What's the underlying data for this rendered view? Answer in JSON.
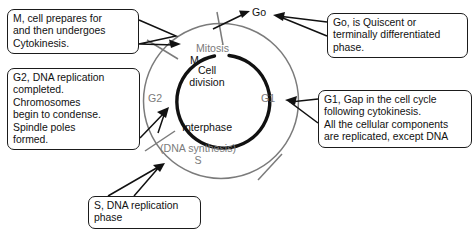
{
  "diagram": {
    "colors": {
      "outer_ring": "#7b7b7b",
      "inner_arc": "#111111",
      "text_black": "#111111",
      "text_gray": "#7b7b7b",
      "callout_border": "#1b1b1b",
      "background": "#ffffff"
    },
    "ring_labels": {
      "mitosis": "Mitosis",
      "m": "M",
      "g2": "G2",
      "g1": "G1",
      "dna_synthesis": "(DNA synthesis)",
      "s": "S"
    },
    "inner_labels": {
      "cell_division_line1": "Cell",
      "cell_division_line2": "division",
      "interphase": "Interphase"
    },
    "exit_label": "Go"
  },
  "callouts": {
    "m_phase": {
      "text": "M, cell prepares for\nand then undergoes\nCytokinesis."
    },
    "g2_phase": {
      "text": "G2, DNA replication\ncompleted.\nChromosomes\nbegin to condense.\nSpindle poles\nformed."
    },
    "g0_phase": {
      "text": "Go, is Quiscent or\nterminally differentiated\nphase."
    },
    "g1_phase": {
      "text": "G1, Gap in the cell cycle\nfollowing cytokinesis.\nAll the cellular components\nare replicated, except DNA"
    },
    "s_phase": {
      "text": "S, DNA replication\nphase"
    }
  }
}
